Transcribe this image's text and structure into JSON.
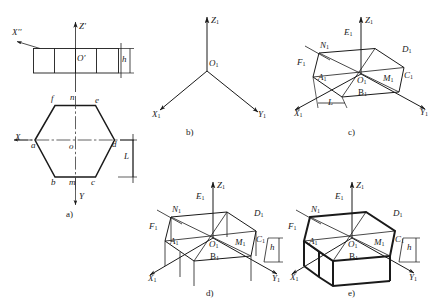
{
  "figure": {
    "stroke_color": "#1a1a1a",
    "thin_width": 0.9,
    "bold_width": 2.0,
    "centerline_color": "#3a3a3a"
  },
  "panels": [
    {
      "key": "a",
      "caption": "a)",
      "description": "Orthographic two-view drawing: front view rectangle and top view hexagon",
      "axes": [
        {
          "name": "Z-prime",
          "label": "Z",
          "prime": "'",
          "direction": "up"
        },
        {
          "name": "X-double-prime",
          "label": "X",
          "prime": "''",
          "direction": "left"
        },
        {
          "name": "X-axis",
          "label": "X",
          "prime": "",
          "direction": "left"
        },
        {
          "name": "Y-axis",
          "label": "Y",
          "prime": "",
          "direction": "down"
        }
      ],
      "origins": [
        {
          "label": "O",
          "prime": "'",
          "view": "front"
        },
        {
          "label": "o",
          "prime": "",
          "view": "top"
        }
      ],
      "dimensions": [
        {
          "name": "height",
          "label": "h",
          "view": "front"
        },
        {
          "name": "width-across-flats",
          "label": "L",
          "view": "top"
        }
      ],
      "front_view": {
        "cells": 4
      },
      "hexagon_vertices": [
        {
          "label": "f",
          "pos": "top-left"
        },
        {
          "label": "n",
          "pos": "top-mid"
        },
        {
          "label": "e",
          "pos": "top-right"
        },
        {
          "label": "a",
          "pos": "left"
        },
        {
          "label": "o",
          "pos": "center"
        },
        {
          "label": "d",
          "pos": "right"
        },
        {
          "label": "b",
          "pos": "bottom-left"
        },
        {
          "label": "m",
          "pos": "bottom-mid"
        },
        {
          "label": "c",
          "pos": "bottom-right"
        }
      ]
    },
    {
      "key": "b",
      "caption": "b)",
      "description": "Isometric axes only",
      "axes": [
        {
          "name": "Z1",
          "label": "Z",
          "sub": "1",
          "direction": "up"
        },
        {
          "name": "X1",
          "label": "X",
          "sub": "1",
          "direction": "lower-left"
        },
        {
          "name": "Y1",
          "label": "Y",
          "sub": "1",
          "direction": "lower-right"
        }
      ],
      "origin": {
        "label": "O",
        "sub": "1"
      }
    },
    {
      "key": "c",
      "caption": "c)",
      "description": "Isometric base hexagon constructed on the axes",
      "axes": [
        {
          "name": "Z1",
          "label": "Z",
          "sub": "1",
          "direction": "up"
        },
        {
          "name": "X1",
          "label": "X",
          "sub": "1",
          "direction": "lower-left"
        },
        {
          "name": "Y1",
          "label": "Y",
          "sub": "1",
          "direction": "lower-right"
        }
      ],
      "points": [
        {
          "label": "N",
          "sub": "1"
        },
        {
          "label": "E",
          "sub": "1"
        },
        {
          "label": "D",
          "sub": "1"
        },
        {
          "label": "F",
          "sub": "1"
        },
        {
          "label": "C",
          "sub": "1"
        },
        {
          "label": "A",
          "sub": "1"
        },
        {
          "label": "O",
          "sub": "1"
        },
        {
          "label": "M",
          "sub": "1"
        },
        {
          "label": "B",
          "sub": "1"
        }
      ],
      "dimensions": [
        {
          "name": "across-flats",
          "label": "L"
        }
      ]
    },
    {
      "key": "d",
      "caption": "d)",
      "description": "Vertical edges of height h projected down from each hexagon vertex",
      "axes": [
        {
          "name": "Z1",
          "label": "Z",
          "sub": "1",
          "direction": "up"
        },
        {
          "name": "X1",
          "label": "X",
          "sub": "1",
          "direction": "lower-left"
        },
        {
          "name": "Y1",
          "label": "Y",
          "sub": "1",
          "direction": "lower-right"
        }
      ],
      "points": [
        {
          "label": "N",
          "sub": "1"
        },
        {
          "label": "E",
          "sub": "1"
        },
        {
          "label": "D",
          "sub": "1"
        },
        {
          "label": "F",
          "sub": "1"
        },
        {
          "label": "C",
          "sub": "1"
        },
        {
          "label": "A",
          "sub": "1"
        },
        {
          "label": "O",
          "sub": "1"
        },
        {
          "label": "M",
          "sub": "1"
        },
        {
          "label": "B",
          "sub": "1"
        }
      ],
      "dimensions": [
        {
          "name": "height",
          "label": "h"
        }
      ]
    },
    {
      "key": "e",
      "caption": "e)",
      "description": "Completed hexagonal prism with outlines darkened",
      "axes": [
        {
          "name": "Z1",
          "label": "Z",
          "sub": "1",
          "direction": "up"
        },
        {
          "name": "X1",
          "label": "X",
          "sub": "1",
          "direction": "lower-left"
        },
        {
          "name": "Y1",
          "label": "Y",
          "sub": "1",
          "direction": "lower-right"
        }
      ],
      "points": [
        {
          "label": "N",
          "sub": "1"
        },
        {
          "label": "E",
          "sub": "1"
        },
        {
          "label": "D",
          "sub": "1"
        },
        {
          "label": "F",
          "sub": "1"
        },
        {
          "label": "C",
          "sub": "1"
        },
        {
          "label": "A",
          "sub": "1"
        },
        {
          "label": "O",
          "sub": "1"
        },
        {
          "label": "M",
          "sub": "1"
        },
        {
          "label": "B",
          "sub": "1"
        }
      ],
      "dimensions": [
        {
          "name": "height",
          "label": "h"
        }
      ]
    }
  ],
  "labels": {
    "a": {
      "z_prime": "Z",
      "z_prime_mark": "'",
      "x_dprime": "X",
      "x_dprime_mark": "''",
      "x": "X",
      "y": "Y",
      "O_front": "O",
      "O_front_mark": "'",
      "o_top": "o",
      "h": "h",
      "L": "L",
      "f": "f",
      "n": "n",
      "e": "e",
      "a": "a",
      "d": "d",
      "b": "b",
      "m": "m",
      "c": "c",
      "caption": "a)"
    },
    "b": {
      "Z": "Z",
      "X": "X",
      "Y": "Y",
      "O": "O",
      "sub": "1",
      "caption": "b)"
    },
    "c": {
      "Z": "Z",
      "X": "X",
      "Y": "Y",
      "N": "N",
      "E": "E",
      "D": "D",
      "F": "F",
      "C": "C",
      "A": "A",
      "O": "O",
      "M": "M",
      "B": "B",
      "sub": "1",
      "L": "L",
      "caption": "c)"
    },
    "d": {
      "Z": "Z",
      "X": "X",
      "Y": "Y",
      "N": "N",
      "E": "E",
      "D": "D",
      "F": "F",
      "C": "C",
      "A": "A",
      "O": "O",
      "M": "M",
      "B": "B",
      "sub": "1",
      "h": "h",
      "caption": "d)"
    },
    "e": {
      "Z": "Z",
      "X": "X",
      "Y": "Y",
      "N": "N",
      "E": "E",
      "D": "D",
      "F": "F",
      "C": "C",
      "A": "A",
      "O": "O",
      "M": "M",
      "B": "B",
      "sub": "1",
      "h": "h",
      "caption": "e)"
    }
  }
}
